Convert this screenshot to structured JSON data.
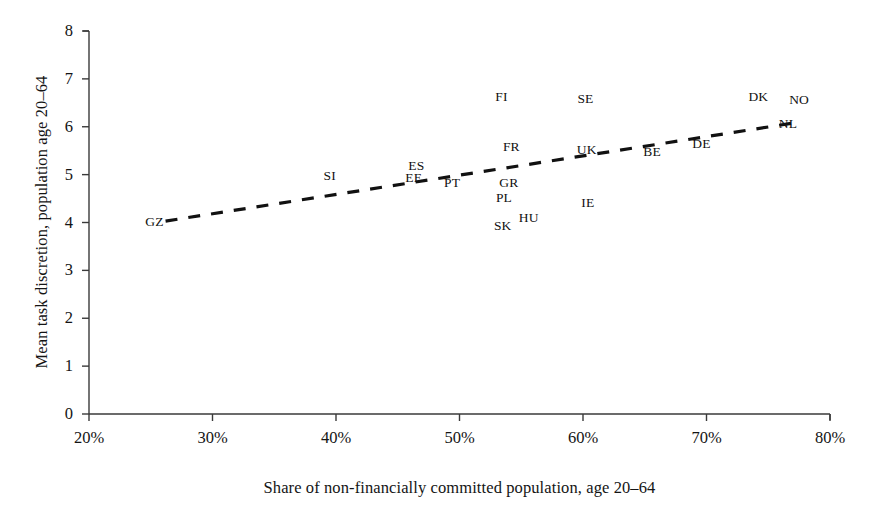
{
  "chart_data": {
    "type": "scatter",
    "title": "",
    "xlabel": "Share of non-financially committed population, age 20–64",
    "ylabel": "Mean task discretion, population age 20–64",
    "xlim": [
      20,
      80
    ],
    "ylim": [
      0,
      8
    ],
    "xticks": [
      20,
      30,
      40,
      50,
      60,
      70,
      80
    ],
    "xtick_labels": [
      "20%",
      "30%",
      "40%",
      "50%",
      "60%",
      "70%",
      "80%"
    ],
    "yticks": [
      0,
      1,
      2,
      3,
      4,
      5,
      6,
      7,
      8
    ],
    "ytick_labels": [
      "0",
      "1",
      "2",
      "3",
      "4",
      "5",
      "6",
      "7",
      "8"
    ],
    "grid": false,
    "legend": "none",
    "marker_style": "text-label",
    "points": [
      {
        "label": "GZ",
        "x": 25.3,
        "y": 4.02
      },
      {
        "label": "SI",
        "x": 39.5,
        "y": 4.98
      },
      {
        "label": "ES",
        "x": 46.5,
        "y": 5.18
      },
      {
        "label": "EE",
        "x": 46.3,
        "y": 4.92
      },
      {
        "label": "PT",
        "x": 49.4,
        "y": 4.83
      },
      {
        "label": "FI",
        "x": 53.4,
        "y": 6.62
      },
      {
        "label": "FR",
        "x": 54.2,
        "y": 5.58
      },
      {
        "label": "GR",
        "x": 54.0,
        "y": 4.83
      },
      {
        "label": "PL",
        "x": 53.6,
        "y": 4.52
      },
      {
        "label": "SK",
        "x": 53.5,
        "y": 3.93
      },
      {
        "label": "HU",
        "x": 55.6,
        "y": 4.1
      },
      {
        "label": "SE",
        "x": 60.2,
        "y": 6.58
      },
      {
        "label": "UK",
        "x": 60.3,
        "y": 5.52
      },
      {
        "label": "IE",
        "x": 60.4,
        "y": 4.4
      },
      {
        "label": "BE",
        "x": 65.6,
        "y": 5.48
      },
      {
        "label": "DE",
        "x": 69.6,
        "y": 5.65
      },
      {
        "label": "DK",
        "x": 74.2,
        "y": 6.62
      },
      {
        "label": "NO",
        "x": 77.5,
        "y": 6.55
      },
      {
        "label": "NL",
        "x": 76.6,
        "y": 6.05
      }
    ],
    "trendline": {
      "style": "dashed",
      "color": "#111111",
      "x_start": 26.2,
      "y_start": 4.03,
      "x_end": 77.1,
      "y_end": 6.08
    }
  },
  "caption": ""
}
